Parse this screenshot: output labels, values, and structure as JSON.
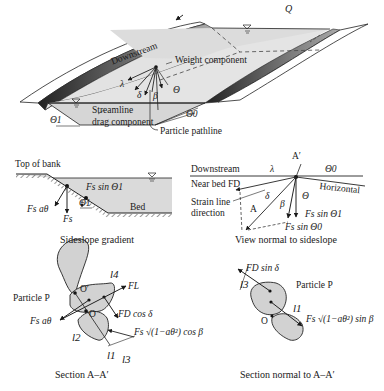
{
  "figure": {
    "top_view": {
      "labels": {
        "discharge": "Q",
        "downstream": "Downstream",
        "weight_component": "Weight component",
        "lambda": "λ",
        "delta": "δ",
        "beta": "β",
        "theta": "Θ",
        "streamline": "Streamline",
        "drag_component": "drag component",
        "theta0": "Θ0",
        "theta1": "Θ1",
        "particle_pathline": "Particle pathline"
      }
    },
    "sideslope_gradient": {
      "caption": "Sideslope gradient",
      "labels": {
        "top_of_bank": "Top of bank",
        "fs_sin_theta1": "Fs sin Θ1",
        "fs_a_theta": "Fs aθ",
        "fs": "Fs",
        "theta1": "Θ1",
        "bed": "Bed"
      }
    },
    "view_normal": {
      "caption": "View normal to sideslope",
      "labels": {
        "a_prime": "A′",
        "downstream": "Downstream",
        "lambda": "λ",
        "theta0": "Θ0",
        "near_bed_fd": "Near bed FD",
        "horizontal": "Horizontal",
        "strain_line_1": "Strain line",
        "strain_line_2": "direction",
        "delta": "δ",
        "a": "A",
        "beta": "β",
        "theta": "Θ",
        "fs_sin_theta1": "Fs sin Θ1",
        "fs_sin_theta0": "Fs sin Θ0"
      }
    },
    "section_aa": {
      "caption": "Section A–A′",
      "labels": {
        "o_prime": "O′",
        "o": "O",
        "particle_p": "Particle P",
        "l1": "l1",
        "l2": "l2",
        "l3": "l3",
        "l4": "l4",
        "fl": "FL",
        "fd_cos_delta": "FD cos δ",
        "fs_a_theta": "Fs aθ",
        "fs_sqrt_cos_beta": "Fs √(1−aθ²) cos β"
      }
    },
    "section_normal": {
      "caption": "Section normal to A–A′",
      "labels": {
        "fd_sin_delta": "FD sin δ",
        "l3": "l3",
        "particle_p": "Particle P",
        "l1": "l1",
        "o": "O",
        "fs_sqrt_sin_beta": "Fs √(1−aθ²) sin β"
      }
    }
  }
}
